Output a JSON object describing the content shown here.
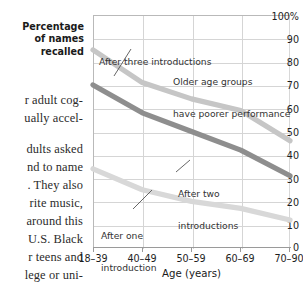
{
  "page_text": {
    "lines": [
      "r adult cog-",
      "ually accel-",
      "dults asked",
      "nd to name",
      ". They also",
      "rite music,",
      "around this",
      "U.S. Black",
      "r teens and",
      "lege or uni-"
    ]
  },
  "chart_caption": {
    "line1": "Percentage",
    "line2": "of names",
    "line3": "recalled"
  },
  "chart_data": {
    "type": "line",
    "title": "",
    "xlabel": "Age (years)",
    "ylabel": "Percentage of names recalled",
    "categories": [
      "18–39",
      "40–49",
      "50–59",
      "60–69",
      "70–90"
    ],
    "ylim": [
      0,
      100
    ],
    "yticks": [
      0,
      10,
      20,
      30,
      40,
      50,
      60,
      70,
      80,
      90,
      100
    ],
    "ytick_labels": [
      "0",
      "10",
      "20",
      "30",
      "40",
      "50",
      "60",
      "70",
      "80",
      "90",
      "100%"
    ],
    "grid": true,
    "legend_position": "inline-annotations",
    "series": [
      {
        "name": "After three introductions",
        "color": "#c6c6c6",
        "values": [
          85,
          71,
          64,
          59,
          46
        ]
      },
      {
        "name": "After two introductions",
        "color": "#8e8e8e",
        "values": [
          70,
          58,
          50,
          42,
          31
        ]
      },
      {
        "name": "After one introduction",
        "color": "#d8d8d8",
        "values": [
          34,
          25,
          20,
          17,
          12
        ]
      }
    ],
    "annotations": [
      {
        "id": "after-three-introductions",
        "text": "After three introductions",
        "lines": [
          "After three introductions"
        ]
      },
      {
        "id": "older-age-groups",
        "text": "Older age groups have poorer performance",
        "lines": [
          "Older age groups",
          "have poorer performance"
        ]
      },
      {
        "id": "after-two-introductions",
        "text": "After two introductions",
        "lines": [
          "After two",
          "introductions"
        ]
      },
      {
        "id": "after-one-introduction",
        "text": "After one introduction",
        "lines": [
          "After one",
          "introduction"
        ]
      }
    ]
  }
}
